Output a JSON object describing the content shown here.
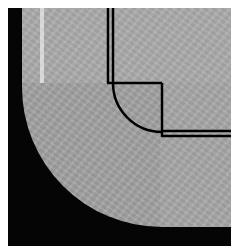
{
  "image": {
    "description": "Grayscale micrograph of a rounded-corner specimen with overlaid black outline diagram",
    "colors": {
      "background": "#ffffff",
      "dark_region": "#050505",
      "specimen_gray": "#a3a3a3",
      "overlay_line": "#000000"
    },
    "overlay": {
      "double_vertical_line_x": [
        108,
        113
      ],
      "double_horizontal_line_y": [
        131,
        136
      ],
      "corner_box": {
        "x1": 113,
        "y1": 83,
        "x2": 162,
        "y2": 133
      },
      "arc_radius": 49
    }
  }
}
